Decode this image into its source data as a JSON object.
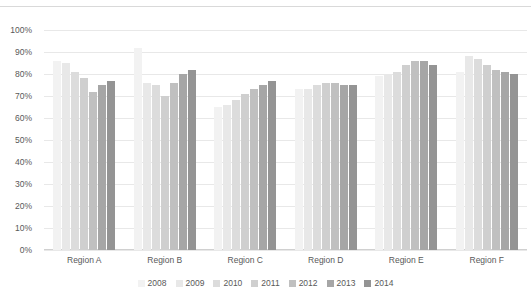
{
  "title": "",
  "axis": {
    "yticks": [
      "100%",
      "90%",
      "80%",
      "70%",
      "60%",
      "50%",
      "40%",
      "30%",
      "20%",
      "10%",
      "0%"
    ]
  },
  "chart_data": {
    "type": "bar",
    "title": "",
    "xlabel": "",
    "ylabel": "",
    "ylim": [
      0,
      100
    ],
    "ytick_values": [
      0,
      10,
      20,
      30,
      40,
      50,
      60,
      70,
      80,
      90,
      100
    ],
    "ytick_labels": [
      "0%",
      "10%",
      "20%",
      "30%",
      "40%",
      "50%",
      "60%",
      "70%",
      "80%",
      "90%",
      "100%"
    ],
    "grid": true,
    "legend_position": "bottom",
    "categories": [
      "Region A",
      "Region B",
      "Region C",
      "Region D",
      "Region E",
      "Region F"
    ],
    "series": [
      {
        "name": "2008",
        "color": "#f2f2f2",
        "values": [
          86,
          92,
          65,
          73,
          79,
          81
        ]
      },
      {
        "name": "2009",
        "color": "#e8e8e8",
        "values": [
          85,
          76,
          66,
          73,
          80,
          88
        ]
      },
      {
        "name": "2010",
        "color": "#dcdcdc",
        "values": [
          81,
          75,
          68,
          75,
          81,
          87
        ]
      },
      {
        "name": "2011",
        "color": "#cfcfcf",
        "values": [
          78,
          70,
          71,
          76,
          84,
          84
        ]
      },
      {
        "name": "2012",
        "color": "#c0c0c0",
        "values": [
          72,
          76,
          73,
          76,
          86,
          82
        ]
      },
      {
        "name": "2013",
        "color": "#a6a6a6",
        "values": [
          75,
          80,
          75,
          75,
          86,
          81
        ]
      },
      {
        "name": "2014",
        "color": "#949494",
        "values": [
          77,
          82,
          77,
          75,
          84,
          80
        ]
      }
    ]
  }
}
